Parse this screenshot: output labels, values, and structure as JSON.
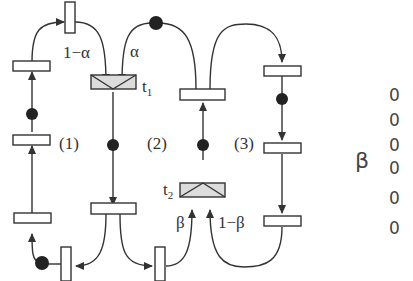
{
  "diagram": {
    "type": "petri-net",
    "labels": {
      "one_minus_alpha": "1−α",
      "alpha": "α",
      "t1": "t",
      "t1_sub": "1",
      "t2": "t",
      "t2_sub": "2",
      "beta": "β",
      "one_minus_beta": "1−β",
      "cycle1": "(1)",
      "cycle2": "(2)",
      "cycle3": "(3)"
    },
    "colors": {
      "stroke": "#333333",
      "token": "#222222",
      "random_transition_fill": "#dcdcdc",
      "transition_fill": "#ffffff"
    }
  },
  "side_axis": {
    "label": "β",
    "ticks": [
      "0",
      "0",
      "0",
      "0",
      "0",
      "0"
    ]
  }
}
